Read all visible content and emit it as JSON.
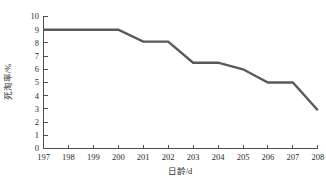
{
  "chart_data": {
    "type": "line",
    "title": "",
    "xlabel": "日龄/d",
    "ylabel": "死淘率/%",
    "x": [
      197,
      198,
      199,
      200,
      201,
      202,
      203,
      204,
      205,
      206,
      207,
      208
    ],
    "values": [
      9.0,
      9.0,
      9.0,
      9.0,
      8.1,
      8.1,
      6.5,
      6.5,
      6.0,
      5.0,
      5.0,
      2.9
    ],
    "series": [
      {
        "name": "死淘率",
        "values": [
          9.0,
          9.0,
          9.0,
          9.0,
          8.1,
          8.1,
          6.5,
          6.5,
          6.0,
          5.0,
          5.0,
          2.9
        ]
      }
    ],
    "xlim": [
      197,
      208
    ],
    "ylim": [
      0,
      10
    ],
    "xticks": [
      "197",
      "198",
      "199",
      "200",
      "201",
      "202",
      "203",
      "204",
      "205",
      "206",
      "207",
      "208"
    ],
    "yticks": [
      "0",
      "1",
      "2",
      "3",
      "4",
      "5",
      "6",
      "7",
      "8",
      "9",
      "10"
    ],
    "grid": false,
    "legend": "none",
    "line_color": "#595959",
    "axis_color": "#4d4d4d"
  }
}
